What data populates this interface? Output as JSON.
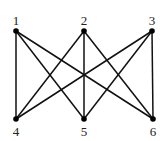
{
  "graph": {
    "name": "K3,3",
    "nodes": [
      {
        "id": "1",
        "label": "1",
        "x": 16,
        "y": 31,
        "lx": 16,
        "ly": 25
      },
      {
        "id": "2",
        "label": "2",
        "x": 84,
        "y": 31,
        "lx": 84,
        "ly": 25
      },
      {
        "id": "3",
        "label": "3",
        "x": 152,
        "y": 31,
        "lx": 152,
        "ly": 25
      },
      {
        "id": "4",
        "label": "4",
        "x": 16,
        "y": 119,
        "lx": 16,
        "ly": 136
      },
      {
        "id": "5",
        "label": "5",
        "x": 84,
        "y": 119,
        "lx": 84,
        "ly": 136
      },
      {
        "id": "6",
        "label": "6",
        "x": 153,
        "y": 119,
        "lx": 153,
        "ly": 136
      }
    ],
    "edges": [
      [
        "1",
        "4"
      ],
      [
        "1",
        "5"
      ],
      [
        "1",
        "6"
      ],
      [
        "2",
        "4"
      ],
      [
        "2",
        "5"
      ],
      [
        "2",
        "6"
      ],
      [
        "3",
        "4"
      ],
      [
        "3",
        "5"
      ],
      [
        "3",
        "6"
      ]
    ],
    "colors": {
      "edge": "#111111",
      "node": "#000000",
      "label": "#222222"
    }
  }
}
